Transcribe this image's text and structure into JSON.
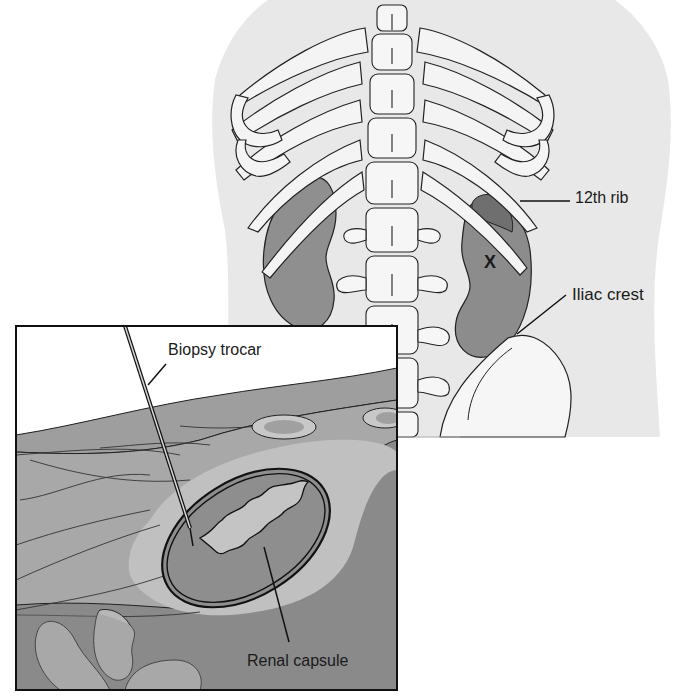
{
  "figure": {
    "type": "anatomical illustration",
    "view": "posterior torso with cross-section inset"
  },
  "labels": {
    "rib": "12th rib",
    "iliac": "Iliac crest",
    "site_marker": "X",
    "trocar": "Biopsy trocar",
    "capsule": "Renal capsule"
  },
  "colors": {
    "skin": "#e6e6e6",
    "bone": "#f4f4f4",
    "kidney": "#8f8f8f",
    "tissue_dark": "#8a8a8a",
    "tissue_mid": "#a8a8a8",
    "tissue_light": "#c4c4c4",
    "outline": "#222222"
  }
}
